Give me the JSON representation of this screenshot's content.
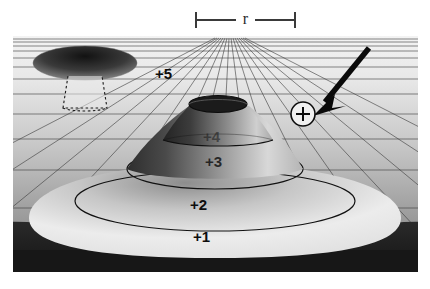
{
  "figure": {
    "title_label": "r",
    "scale_bar": {
      "label": "r",
      "left_tick": "|",
      "right_tick": "|"
    },
    "contour_labels": [
      {
        "text": "+5",
        "x": 142,
        "y": 36
      },
      {
        "text": "+4",
        "x": 190,
        "y": 98
      },
      {
        "text": "+3",
        "x": 192,
        "y": 122
      },
      {
        "text": "+2",
        "x": 177,
        "y": 166
      },
      {
        "text": "+1",
        "x": 180,
        "y": 198
      }
    ],
    "marker": {
      "symbol": "+",
      "label": "test-particle-marker"
    },
    "arrow": {
      "label": "pointer-arrow"
    },
    "inset": {
      "label": "inset-funnel"
    },
    "colors": {
      "grid_line": "#3b3b3b",
      "plane_light": "#e6e6e6",
      "plane_dark": "#9a9a9a",
      "foreground_dark": "#1e1e1e",
      "funnel_light": "#efefef",
      "funnel_dark": "#2a2a2a",
      "marker_fill": "#f2f2f2",
      "ink": "#111111",
      "frame_bg": "#cfcfcf"
    }
  }
}
